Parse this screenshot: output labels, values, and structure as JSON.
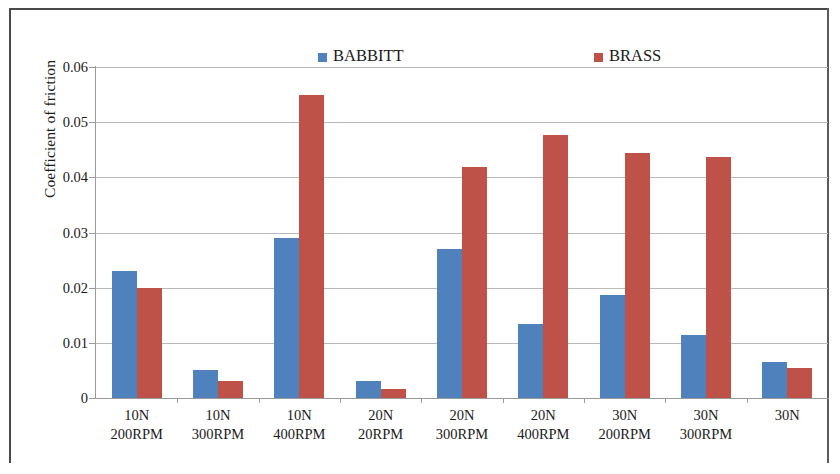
{
  "chart_data": {
    "type": "bar",
    "title": "",
    "xlabel": "",
    "ylabel": "Coefficient of friction",
    "ylim": [
      0,
      0.06
    ],
    "ytick_labels": [
      "0",
      "0.01",
      "0.02",
      "0.03",
      "0.04",
      "0.05",
      "0.06"
    ],
    "ytick_values": [
      0,
      0.01,
      0.02,
      0.03,
      0.04,
      0.05,
      0.06
    ],
    "grid": true,
    "legend_position": "top-center",
    "categories": [
      {
        "load": "10N",
        "speed": "200RPM"
      },
      {
        "load": "10N",
        "speed": "300RPM"
      },
      {
        "load": "10N",
        "speed": "400RPM"
      },
      {
        "load": "20N",
        "speed": "20RPM"
      },
      {
        "load": "20N",
        "speed": "300RPM"
      },
      {
        "load": "20N",
        "speed": "400RPM"
      },
      {
        "load": "30N",
        "speed": "200RPM"
      },
      {
        "load": "30N",
        "speed": "300RPM"
      },
      {
        "load": "30N",
        "speed": ""
      }
    ],
    "series": [
      {
        "name": "BABBITT",
        "color": "#4F81BD",
        "values": [
          0.023,
          0.005,
          0.029,
          0.003,
          0.027,
          0.0135,
          0.0187,
          0.0115,
          0.0065
        ]
      },
      {
        "name": "BRASS",
        "color": "#BE5148",
        "values": [
          0.02,
          0.003,
          0.055,
          0.0017,
          0.0418,
          0.0477,
          0.0445,
          0.0436,
          0.0055
        ]
      }
    ]
  }
}
